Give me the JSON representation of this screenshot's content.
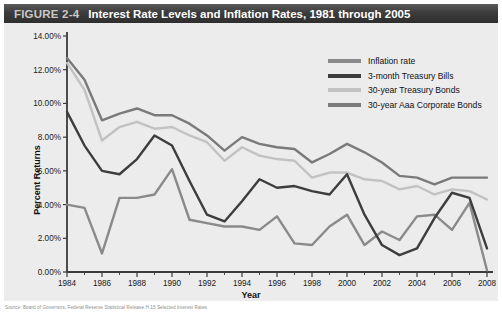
{
  "header": {
    "figure_number": "FIGURE 2-4",
    "title": "Interest Rate Levels and Inflation Rates, 1981 through 2005"
  },
  "source_note": "Source: Board of Governors, Federal Reserve Statistical Release H.15 Selected Interest Rates.",
  "colors": {
    "panel_background": "#ececec",
    "header_dark": "#3c3c3c",
    "axis": "#3a3a3a",
    "inflation_rate": "#8a8a8a",
    "treasury_bills_3m": "#3d3d3d",
    "treasury_bonds_30y": "#c2c2c2",
    "aaa_corporate_30y": "#7a7a7a"
  },
  "legend": {
    "position": "top-right",
    "items": [
      {
        "label": "Inflation rate",
        "color": "#8a8a8a"
      },
      {
        "label": "3-month Treasury Bills",
        "color": "#3d3d3d"
      },
      {
        "label": "30-year Treasury Bonds",
        "color": "#c2c2c2"
      },
      {
        "label": "30-year Aaa Corporate Bonds",
        "color": "#7a7a7a"
      }
    ]
  },
  "chart_data": {
    "type": "line",
    "title": "Interest Rate Levels and Inflation Rates, 1981 through 2005",
    "xlabel": "Year",
    "ylabel": "Percent Returns",
    "xlim": [
      1984,
      2008
    ],
    "ylim": [
      0,
      14
    ],
    "ytick_step": 2,
    "grid": false,
    "ytick_labels": [
      "0.00%",
      "2.00%",
      "4.00%",
      "6.00%",
      "8.00%",
      "10.00%",
      "12.00%",
      "14.00%"
    ],
    "ytick_values": [
      0,
      2,
      4,
      6,
      8,
      10,
      12,
      14
    ],
    "xtick_labels": [
      "1984",
      "1986",
      "1988",
      "1990",
      "1992",
      "1994",
      "1996",
      "1998",
      "2000",
      "2002",
      "2004",
      "2006",
      "2008"
    ],
    "xtick_values": [
      1984,
      1986,
      1988,
      1990,
      1992,
      1994,
      1996,
      1998,
      2000,
      2002,
      2004,
      2006,
      2008
    ],
    "x": [
      1984,
      1985,
      1986,
      1987,
      1988,
      1989,
      1990,
      1991,
      1992,
      1993,
      1994,
      1995,
      1996,
      1997,
      1998,
      1999,
      2000,
      2001,
      2002,
      2003,
      2004,
      2005,
      2006,
      2007,
      2008
    ],
    "series": [
      {
        "name": "Inflation rate",
        "color": "#8a8a8a",
        "values": [
          4.0,
          3.8,
          1.1,
          4.4,
          4.4,
          4.6,
          6.1,
          3.1,
          2.9,
          2.7,
          2.7,
          2.5,
          3.3,
          1.7,
          1.6,
          2.7,
          3.4,
          1.6,
          2.4,
          1.9,
          3.3,
          3.4,
          2.5,
          4.1,
          0.1
        ]
      },
      {
        "name": "3-month Treasury Bills",
        "color": "#3d3d3d",
        "values": [
          9.5,
          7.5,
          6.0,
          5.8,
          6.7,
          8.1,
          7.5,
          5.4,
          3.4,
          3.0,
          4.2,
          5.5,
          5.0,
          5.1,
          4.8,
          4.6,
          5.8,
          3.4,
          1.6,
          1.0,
          1.4,
          3.2,
          4.7,
          4.4,
          1.4
        ]
      },
      {
        "name": "30-year Treasury Bonds",
        "color": "#c2c2c2",
        "values": [
          12.4,
          10.8,
          7.8,
          8.6,
          8.9,
          8.5,
          8.6,
          8.1,
          7.7,
          6.6,
          7.4,
          6.9,
          6.7,
          6.6,
          5.6,
          5.9,
          5.9,
          5.5,
          5.4,
          4.9,
          5.1,
          4.6,
          4.9,
          4.8,
          4.3
        ]
      },
      {
        "name": "30-year Aaa Corporate Bonds",
        "color": "#7a7a7a",
        "values": [
          12.7,
          11.4,
          9.0,
          9.4,
          9.7,
          9.3,
          9.3,
          8.8,
          8.1,
          7.2,
          8.0,
          7.6,
          7.4,
          7.3,
          6.5,
          7.0,
          7.6,
          7.1,
          6.5,
          5.7,
          5.6,
          5.2,
          5.6,
          5.6,
          5.6
        ]
      }
    ]
  }
}
